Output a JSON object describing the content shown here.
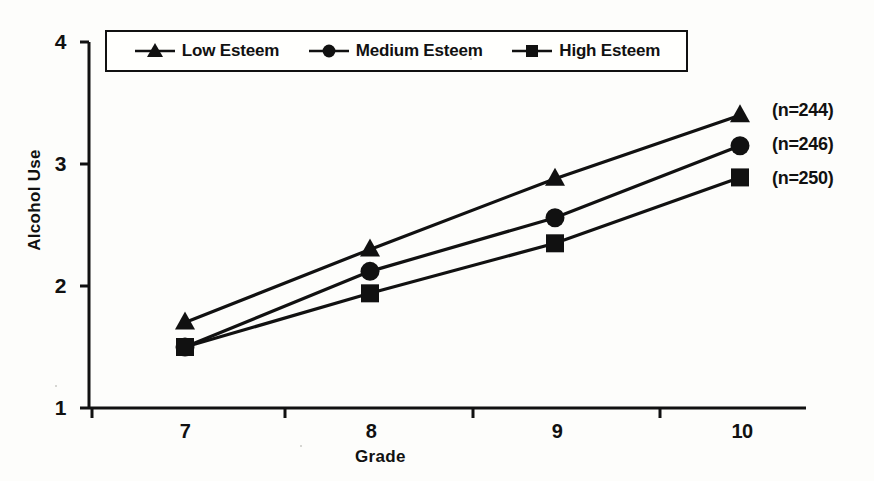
{
  "chart_data": {
    "type": "line",
    "title": "",
    "xlabel": "Grade",
    "ylabel": "Alcohol Use",
    "categories": [
      "7",
      "8",
      "9",
      "10"
    ],
    "x": [
      7,
      8,
      9,
      10
    ],
    "xlim": [
      6.5,
      10.5
    ],
    "ylim": [
      1,
      4
    ],
    "yticks": [
      "1",
      "2",
      "3",
      "4"
    ],
    "ytick_values": [
      1,
      2,
      3,
      4
    ],
    "grid": false,
    "legend_position": "top-inside-box",
    "series": [
      {
        "name": "Low Esteem",
        "marker": "triangle",
        "values": [
          1.7,
          2.3,
          2.88,
          3.4
        ],
        "annotation": "(n=244)"
      },
      {
        "name": "Medium Esteem",
        "marker": "circle",
        "values": [
          1.5,
          2.12,
          2.56,
          3.15
        ],
        "annotation": "(n=246)"
      },
      {
        "name": "High Esteem",
        "marker": "square",
        "values": [
          1.5,
          1.94,
          2.35,
          2.89
        ]
      }
    ],
    "annotations": [
      "(n=244)",
      "(n=246)",
      "(n=250)"
    ]
  },
  "axes": {
    "y_title": "Alcohol Use",
    "x_title": "Grade",
    "y_tick_labels": [
      "4",
      "3",
      "2",
      "1"
    ],
    "x_tick_labels": [
      "7",
      "8",
      "9",
      "10"
    ]
  },
  "legend": {
    "items": [
      {
        "label": "Low Esteem",
        "marker": "triangle"
      },
      {
        "label": "Medium Esteem",
        "marker": "circle"
      },
      {
        "label": "High Esteem",
        "marker": "square"
      }
    ]
  },
  "annotations": {
    "low": "(n=244)",
    "medium": "(n=246)",
    "high": "(n=250)"
  },
  "colors": {
    "ink": "#111111",
    "paper": "#fdfdfb"
  }
}
